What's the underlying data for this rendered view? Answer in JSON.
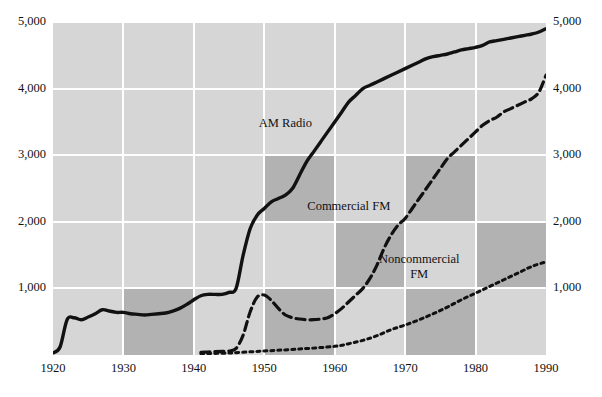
{
  "chart_data": {
    "type": "line",
    "title": "",
    "xlabel": "",
    "ylabel": "",
    "xlim": [
      1920,
      1990
    ],
    "ylim": [
      0,
      5000
    ],
    "grid": true,
    "legend_position": "inline-annotations",
    "x_ticks": [
      "1920",
      "1930",
      "1940",
      "1950",
      "1960",
      "1970",
      "1980",
      "1990"
    ],
    "x_tick_values": [
      1920,
      1930,
      1940,
      1950,
      1960,
      1970,
      1980,
      1990
    ],
    "y_ticks": [
      "1,000",
      "2,000",
      "3,000",
      "4,000",
      "5,000"
    ],
    "y_tick_values": [
      1000,
      2000,
      3000,
      4000,
      5000
    ],
    "y_axis_left": [
      "5,000",
      "4,000",
      "3,000",
      "2,000",
      "1,000"
    ],
    "y_axis_right": [
      "5,000",
      "4,000",
      "3,000",
      "2,000",
      "1,000"
    ],
    "series": [
      {
        "name": "AM Radio",
        "style": "solid",
        "color": "#111111",
        "label_text": "AM Radio",
        "x": [
          1920,
          1921,
          1922,
          1923,
          1924,
          1925,
          1926,
          1927,
          1928,
          1929,
          1930,
          1931,
          1932,
          1933,
          1934,
          1935,
          1936,
          1937,
          1938,
          1939,
          1940,
          1941,
          1942,
          1943,
          1944,
          1945,
          1946,
          1947,
          1948,
          1949,
          1950,
          1951,
          1952,
          1953,
          1954,
          1955,
          1956,
          1957,
          1958,
          1959,
          1960,
          1961,
          1962,
          1963,
          1964,
          1965,
          1966,
          1967,
          1968,
          1969,
          1970,
          1971,
          1972,
          1973,
          1974,
          1975,
          1976,
          1977,
          1978,
          1979,
          1980,
          1981,
          1982,
          1983,
          1984,
          1985,
          1986,
          1987,
          1988,
          1989,
          1990
        ],
        "values": [
          30,
          120,
          530,
          560,
          530,
          570,
          620,
          680,
          660,
          640,
          640,
          620,
          610,
          600,
          610,
          620,
          630,
          660,
          700,
          760,
          830,
          890,
          910,
          910,
          910,
          940,
          1000,
          1500,
          1900,
          2100,
          2200,
          2300,
          2350,
          2400,
          2500,
          2700,
          2900,
          3050,
          3200,
          3350,
          3500,
          3650,
          3800,
          3900,
          4000,
          4050,
          4100,
          4150,
          4200,
          4250,
          4300,
          4350,
          4400,
          4450,
          4480,
          4500,
          4520,
          4550,
          4580,
          4600,
          4620,
          4650,
          4700,
          4720,
          4740,
          4760,
          4780,
          4800,
          4820,
          4850,
          4900
        ]
      },
      {
        "name": "Commercial FM",
        "style": "dashed",
        "color": "#111111",
        "label_text": "Commercial FM",
        "x": [
          1941,
          1942,
          1943,
          1944,
          1945,
          1946,
          1947,
          1948,
          1949,
          1950,
          1951,
          1952,
          1953,
          1954,
          1955,
          1956,
          1957,
          1958,
          1959,
          1960,
          1961,
          1962,
          1963,
          1964,
          1965,
          1966,
          1967,
          1968,
          1969,
          1970,
          1971,
          1972,
          1973,
          1974,
          1975,
          1976,
          1977,
          1978,
          1979,
          1980,
          1981,
          1982,
          1983,
          1984,
          1985,
          1986,
          1987,
          1988,
          1989,
          1990
        ],
        "values": [
          40,
          45,
          50,
          55,
          60,
          100,
          300,
          650,
          870,
          900,
          820,
          700,
          600,
          560,
          540,
          530,
          530,
          540,
          560,
          620,
          700,
          800,
          900,
          1000,
          1150,
          1350,
          1600,
          1800,
          1950,
          2050,
          2200,
          2350,
          2500,
          2650,
          2800,
          2950,
          3050,
          3150,
          3250,
          3350,
          3450,
          3520,
          3570,
          3650,
          3700,
          3750,
          3800,
          3850,
          3950,
          4200
        ]
      },
      {
        "name": "Noncommercial FM",
        "style": "dotted",
        "color": "#111111",
        "label_text": "Noncommercial\nFM",
        "x": [
          1941,
          1945,
          1950,
          1955,
          1960,
          1962,
          1964,
          1966,
          1968,
          1970,
          1972,
          1974,
          1976,
          1978,
          1980,
          1982,
          1984,
          1986,
          1988,
          1990
        ],
        "values": [
          20,
          30,
          60,
          90,
          130,
          170,
          220,
          290,
          380,
          450,
          530,
          620,
          720,
          830,
          930,
          1030,
          1130,
          1230,
          1330,
          1400
        ]
      }
    ],
    "annotations": [
      {
        "text": "AM Radio",
        "x": 1953,
        "y": 3480
      },
      {
        "text": "Commercial FM",
        "x": 1962,
        "y": 2230
      },
      {
        "text": "Noncommercial\nFM",
        "x": 1972,
        "y": 1330
      }
    ],
    "background": {
      "light_cell": "#d6d6d6",
      "dark_cell": "#b2b2b2",
      "gridline": "#ffffff",
      "page": "#ffffff"
    }
  }
}
